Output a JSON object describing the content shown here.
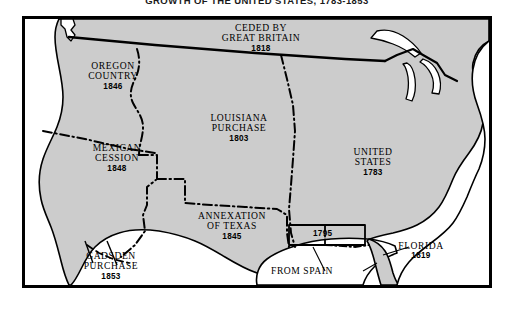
{
  "title": "GROWTH OF THE UNITED STATES, 1783-1853",
  "colors": {
    "land": "#cccccc",
    "water": "#ffffff",
    "outline": "#000000",
    "frame": "#000000",
    "text": "#000000"
  },
  "regions": [
    {
      "id": "oregon-country",
      "name": "OREGON COUNTRY",
      "line1": "OREGON",
      "line2": "COUNTRY",
      "year": "1846"
    },
    {
      "id": "ceded-by-great-britain",
      "name": "CEDED BY GREAT BRITAIN",
      "line1": "CEDED BY",
      "line2": "GREAT BRITAIN",
      "year": "1818"
    },
    {
      "id": "louisiana-purchase",
      "name": "LOUISIANA PURCHASE",
      "line1": "LOUISIANA",
      "line2": "PURCHASE",
      "year": "1803"
    },
    {
      "id": "mexican-cession",
      "name": "MEXICAN CESSION",
      "line1": "MEXICAN",
      "line2": "CESSION",
      "year": "1848"
    },
    {
      "id": "united-states",
      "name": "UNITED STATES",
      "line1": "UNITED",
      "line2": "STATES",
      "year": "1783"
    },
    {
      "id": "annexation-of-texas",
      "name": "ANNEXATION OF TEXAS",
      "line1": "ANNEXATION",
      "line2": "OF TEXAS",
      "year": "1845"
    },
    {
      "id": "gadsden-purchase",
      "name": "GADSDEN PURCHASE",
      "line1": "GADSDEN",
      "line2": "PURCHASE",
      "year": "1853"
    },
    {
      "id": "florida",
      "name": "FLORIDA",
      "line1": "FLORIDA",
      "line2": "",
      "year": "1819"
    }
  ],
  "annotations": {
    "gulf_strip_year": "1795",
    "from_spain": "FROM SPAIN"
  }
}
